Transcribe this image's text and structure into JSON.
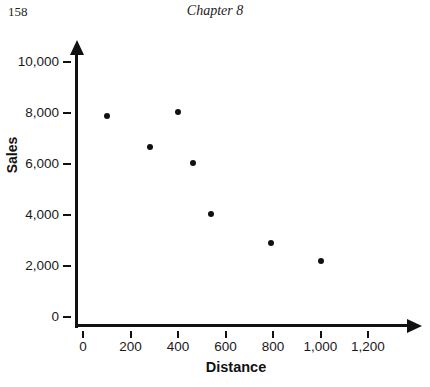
{
  "page": {
    "page_number": "158",
    "chapter_header": "Chapter 8"
  },
  "chart_data": {
    "type": "scatter",
    "title": "",
    "xlabel": "Distance",
    "ylabel": "Sales",
    "points": [
      {
        "x": 100,
        "y": 7900
      },
      {
        "x": 280,
        "y": 6650
      },
      {
        "x": 400,
        "y": 8050
      },
      {
        "x": 465,
        "y": 6050
      },
      {
        "x": 540,
        "y": 4050
      },
      {
        "x": 790,
        "y": 2900
      },
      {
        "x": 1000,
        "y": 2200
      }
    ],
    "x_ticks": [
      0,
      200,
      400,
      600,
      800,
      1000,
      1200
    ],
    "x_tick_labels": [
      "0",
      "200",
      "400",
      "600",
      "800",
      "1,000",
      "1,200"
    ],
    "y_ticks": [
      0,
      2000,
      4000,
      6000,
      8000,
      10000
    ],
    "y_tick_labels": [
      "0",
      "2,000",
      "4,000",
      "6,000",
      "8,000",
      "10,000"
    ],
    "xlim": [
      0,
      1200
    ],
    "ylim": [
      0,
      10000
    ],
    "grid": false,
    "legend": null,
    "point_color": "#111111",
    "axis_color": "#111111"
  }
}
